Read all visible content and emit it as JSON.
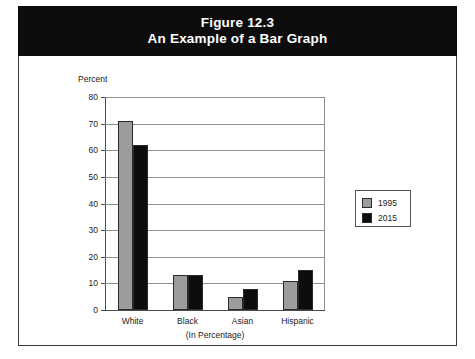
{
  "figure": {
    "number_label": "Figure 12.3",
    "caption_label": "An Example of a Bar Graph"
  },
  "legend": {
    "position": "right",
    "entries": [
      {
        "label": "1995",
        "color": "#9c9c9c"
      },
      {
        "label": "2015",
        "color": "#0d0d0d"
      }
    ]
  },
  "axis": {
    "y_title": "Percent",
    "ticks": [
      "80",
      "70",
      "60",
      "50",
      "40",
      "30",
      "20",
      "10",
      "0"
    ],
    "x_caption": "(In Percentage)"
  },
  "chart_data": {
    "type": "bar",
    "title": "An Example of a Bar Graph",
    "subtitle": "Figure 12.3",
    "categories": [
      "White",
      "Black",
      "Asian",
      "Hispanic"
    ],
    "series": [
      {
        "name": "1995",
        "color": "#9c9c9c",
        "values": [
          71,
          13,
          5,
          11
        ]
      },
      {
        "name": "2015",
        "color": "#0d0d0d",
        "values": [
          62,
          13,
          8,
          15
        ]
      }
    ],
    "xlabel": "(In Percentage)",
    "ylabel": "Percent",
    "ylim": [
      0,
      80
    ],
    "ytick_step": 10,
    "grid": true,
    "legend_position": "right"
  }
}
